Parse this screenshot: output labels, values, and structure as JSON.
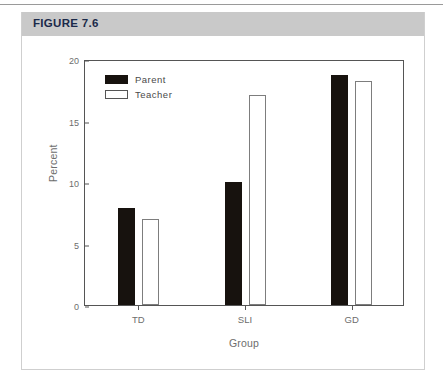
{
  "figure": {
    "title": "FIGURE 7.6",
    "header_color": "#c9c9c9",
    "title_color": "#1b2a4a"
  },
  "chart_data": {
    "type": "bar",
    "title": "",
    "subtitle": "",
    "xlabel": "Group",
    "ylabel": "Percent",
    "categories": [
      "TD",
      "SLI",
      "GD"
    ],
    "series": [
      {
        "name": "Parent",
        "values": [
          7.9,
          10.0,
          18.7
        ],
        "color": "#17120e",
        "fill": "solid"
      },
      {
        "name": "Teacher",
        "values": [
          7.0,
          17.1,
          18.2
        ],
        "color": "#ffffff",
        "fill": "outline"
      }
    ],
    "ylim": [
      0,
      20
    ],
    "yticks": [
      0,
      5,
      10,
      15,
      20
    ],
    "ytick_labels": [
      "0",
      "5",
      "10",
      "15",
      "20"
    ],
    "grid": false,
    "legend_position": "upper-left"
  }
}
